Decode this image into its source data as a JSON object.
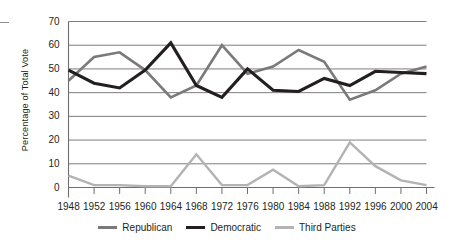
{
  "chart_data": {
    "type": "line",
    "title": "",
    "subtitle": "",
    "xlabel": "",
    "ylabel": "Percentage of Total Vote",
    "x": [
      1948,
      1952,
      1956,
      1960,
      1964,
      1968,
      1972,
      1976,
      1980,
      1984,
      1988,
      1992,
      1996,
      2000,
      2004
    ],
    "categories": [
      "1948",
      "1952",
      "1956",
      "1960",
      "1964",
      "1968",
      "1972",
      "1976",
      "1980",
      "1984",
      "1988",
      "1992",
      "1996",
      "2000",
      "2004"
    ],
    "xlim": [
      1948,
      2004
    ],
    "ylim": [
      0,
      70
    ],
    "yticks": [
      0,
      10,
      20,
      30,
      40,
      50,
      60,
      70
    ],
    "ytick_labels": [
      "0",
      "10",
      "20",
      "30",
      "40",
      "50",
      "60",
      "70"
    ],
    "grid": "horizontal",
    "legend_position": "bottom",
    "series": [
      {
        "name": "Republican",
        "color": "#7a7a7a",
        "values": [
          45,
          55,
          57,
          49.5,
          38,
          43,
          60,
          48,
          51,
          58,
          53,
          37,
          41,
          48,
          51
        ]
      },
      {
        "name": "Democratic",
        "color": "#231f20",
        "values": [
          49.5,
          44,
          42,
          49.5,
          61,
          43,
          38,
          50,
          41,
          40.5,
          46,
          43,
          49,
          48.5,
          48
        ]
      },
      {
        "name": "Third Parties",
        "color": "#b3b3b3",
        "values": [
          5,
          1,
          1,
          0.5,
          0.5,
          14,
          1,
          1,
          7.5,
          0.5,
          1,
          19,
          9,
          3,
          1
        ]
      }
    ]
  },
  "legend": {
    "items": [
      {
        "label": "Republican",
        "color": "#7a7a7a",
        "thickness": 3
      },
      {
        "label": "Democratic",
        "color": "#231f20",
        "thickness": 3.4
      },
      {
        "label": "Third Parties",
        "color": "#b3b3b3",
        "thickness": 3
      }
    ]
  },
  "axes": {
    "y_title": "Percentage of Total Vote",
    "y_labels": [
      "70",
      "60",
      "50",
      "40",
      "30",
      "20",
      "10",
      "0"
    ],
    "x_labels": [
      "1948",
      "1952",
      "1956",
      "1960",
      "1964",
      "1968",
      "1972",
      "1976",
      "1980",
      "1984",
      "1988",
      "1992",
      "1996",
      "2000",
      "2004"
    ]
  }
}
